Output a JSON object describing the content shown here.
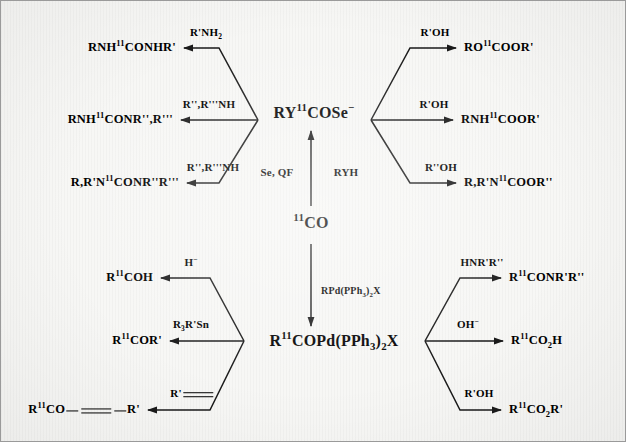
{
  "diagram": {
    "background_color": "#f7f7f5",
    "border_color": "#9a9a9a",
    "line_color": "#1a1a1a"
  },
  "center": {
    "precursor_label": "CO",
    "precursor_superscript": "11",
    "selenium_node": {
      "prefix": "RY",
      "superscript": "11",
      "suffix": "COSe",
      "charge": "−"
    },
    "palladium_node": {
      "prefix": "R",
      "superscript": "11",
      "suffix_a": "COPd(PPh",
      "sub_a": "3",
      "suffix_b": ")",
      "sub_b": "2",
      "suffix_c": "X"
    },
    "up_reagent_left": "Se, QF",
    "up_reagent_right": "RYH",
    "down_reagent": {
      "text_a": "RPd(PPh",
      "sub_a": "3",
      "text_b": ")",
      "sub_b": "2",
      "text_c": "X"
    }
  },
  "branches": {
    "top_left": [
      {
        "reagent": "R'NH",
        "reagent_sub": "2",
        "product_pre": "RNH",
        "product_sup": "11",
        "product_post": "CONHR'"
      },
      {
        "reagent": "R'',R'''NH",
        "reagent_sub": "",
        "product_pre": "RNH",
        "product_sup": "11",
        "product_post": "CONR'',R'''"
      },
      {
        "reagent": "R'',R'''NH",
        "reagent_sub": "",
        "product_pre": "R,R'N",
        "product_sup": "11",
        "product_post": "CONR''R'''"
      }
    ],
    "top_right": [
      {
        "reagent": "R'OH",
        "product_pre": "RO",
        "product_sup": "11",
        "product_post": "COOR'"
      },
      {
        "reagent": "R'OH",
        "product_pre": "RNH",
        "product_sup": "11",
        "product_post": "COOR'"
      },
      {
        "reagent": "R''OH",
        "product_pre": "R,R'N",
        "product_sup": "11",
        "product_post": "COOR''"
      }
    ],
    "bottom_left": [
      {
        "reagent": "H",
        "reagent_sup": "−",
        "product_pre": "R",
        "product_sup": "11",
        "product_post": "COH"
      },
      {
        "reagent": "R",
        "reagent_sub": "3",
        "reagent_post": "R'Sn",
        "product_pre": "R",
        "product_sup": "11",
        "product_post": "COR'"
      },
      {
        "reagent": "R'",
        "reagent_is_alkyne": true,
        "product_pre": "R",
        "product_sup": "11",
        "product_post": "CO",
        "product_tail": "R'",
        "product_is_alkyne": true
      }
    ],
    "bottom_right": [
      {
        "reagent": "HNR'R''",
        "product_pre": "R",
        "product_sup": "11",
        "product_post": "CONR'R''"
      },
      {
        "reagent": "OH",
        "reagent_sup": "−",
        "product_pre": "R",
        "product_sup": "11",
        "product_post_a": "CO",
        "product_sub": "2",
        "product_post_b": "H"
      },
      {
        "reagent": "R'OH",
        "product_pre": "R",
        "product_sup": "11",
        "product_post_a": "CO",
        "product_sub": "2",
        "product_post_b": "R'"
      }
    ]
  }
}
